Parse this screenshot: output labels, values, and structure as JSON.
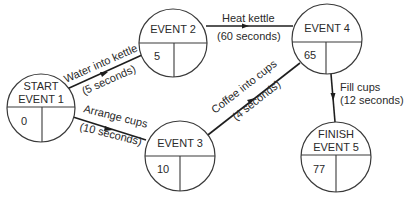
{
  "diagram": {
    "type": "network-diagram",
    "nodes": [
      {
        "id": "event1",
        "title_lines": [
          "START",
          "EVENT 1"
        ],
        "time": "0",
        "right_value": ""
      },
      {
        "id": "event2",
        "title_lines": [
          "EVENT 2"
        ],
        "time": "5",
        "right_value": ""
      },
      {
        "id": "event3",
        "title_lines": [
          "EVENT 3"
        ],
        "time": "10",
        "right_value": ""
      },
      {
        "id": "event4",
        "title_lines": [
          "EVENT 4"
        ],
        "time": "65",
        "right_value": ""
      },
      {
        "id": "event5",
        "title_lines": [
          "FINISH",
          "EVENT 5"
        ],
        "time": "77",
        "right_value": ""
      }
    ],
    "edges": [
      {
        "id": "water",
        "from": "event1",
        "to": "event2",
        "activity": "Water into kettle",
        "duration": "(5 seconds)"
      },
      {
        "id": "arrange",
        "from": "event1",
        "to": "event3",
        "activity": "Arrange cups",
        "duration": "(10 seconds)"
      },
      {
        "id": "heat",
        "from": "event2",
        "to": "event4",
        "activity": "Heat kettle",
        "duration": "(60 seconds)"
      },
      {
        "id": "coffee",
        "from": "event3",
        "to": "event4",
        "activity": "Coffee into cups",
        "duration": "(4 seconds)"
      },
      {
        "id": "fill",
        "from": "event4",
        "to": "event5",
        "activity": "Fill cups",
        "duration": "(12 seconds)"
      }
    ],
    "colors": {
      "line": "#1e1e1e",
      "text": "#2a2a2a",
      "background": "#ffffff"
    }
  }
}
